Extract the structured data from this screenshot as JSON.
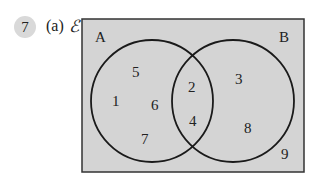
{
  "question": {
    "number": "7",
    "part": "(a)",
    "universal_symbol": "ℰ"
  },
  "venn": {
    "set_a_label": "A",
    "set_b_label": "B",
    "only_a": [
      "5",
      "1",
      "6",
      "7"
    ],
    "intersection": [
      "2",
      "4"
    ],
    "only_b": [
      "3",
      "8"
    ],
    "outside": [
      "9"
    ],
    "colors": {
      "background": "#d4d4d4",
      "outline": "#222222"
    }
  }
}
